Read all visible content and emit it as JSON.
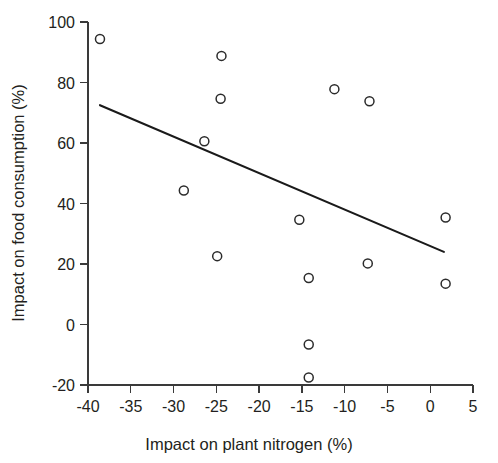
{
  "chart_data": {
    "type": "scatter",
    "title": "",
    "xlabel": "Impact on plant nitrogen (%)",
    "ylabel": "Impact on food consumption (%)",
    "xlim": [
      -40,
      5
    ],
    "ylim": [
      -20,
      100
    ],
    "xticks": [
      -40,
      -35,
      -30,
      -25,
      -20,
      -15,
      -10,
      -5,
      0,
      5
    ],
    "xticklabels": [
      "-40",
      "-35",
      "-30",
      "-25",
      "-20",
      "-15",
      "-10",
      "-5",
      "0",
      "5"
    ],
    "yticks": [
      -20,
      0,
      20,
      40,
      60,
      80,
      100
    ],
    "yticklabels": [
      "-20",
      "0",
      "20",
      "40",
      "60",
      "80",
      "100"
    ],
    "grid": false,
    "legend": null,
    "marker": {
      "shape": "open-circle",
      "size": 9,
      "edge_color": "#2b2b2b",
      "fill_color": "none"
    },
    "points": [
      {
        "x": -38.6,
        "y": 94.4
      },
      {
        "x": -24.4,
        "y": 88.8
      },
      {
        "x": -24.5,
        "y": 74.6
      },
      {
        "x": -11.2,
        "y": 77.8
      },
      {
        "x": -7.1,
        "y": 73.8
      },
      {
        "x": -26.4,
        "y": 60.6
      },
      {
        "x": -28.8,
        "y": 44.3
      },
      {
        "x": -15.3,
        "y": 34.6
      },
      {
        "x": 1.8,
        "y": 35.4
      },
      {
        "x": -24.9,
        "y": 22.6
      },
      {
        "x": -7.3,
        "y": 20.2
      },
      {
        "x": -14.2,
        "y": 15.4
      },
      {
        "x": 1.8,
        "y": 13.5
      },
      {
        "x": -14.2,
        "y": -6.6
      },
      {
        "x": -14.2,
        "y": -17.5
      }
    ],
    "trendline": {
      "type": "linear-fit",
      "color": "#1a1a1a",
      "x_start": -38.6,
      "y_start": 72.5,
      "x_end": 1.6,
      "y_end": 24.0
    }
  }
}
